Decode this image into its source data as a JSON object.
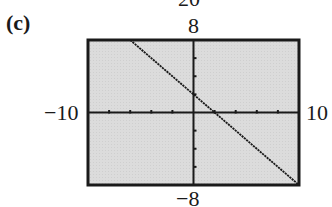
{
  "figure": {
    "part_label": "(c)",
    "cut_off_label": "20",
    "background_color": "#dcdcdc",
    "frame_color": "#1a1a1a",
    "line_color": "#1a1a1a"
  },
  "chart_data": {
    "type": "line",
    "title": "",
    "xlabel": "",
    "ylabel": "",
    "xlim": [
      -10,
      10
    ],
    "ylim": [
      -8,
      8
    ],
    "xscl": 2,
    "yscl": 2,
    "grid": false,
    "tick_labels": {
      "xmin": "−10",
      "xmax": "10",
      "ymin": "−8",
      "ymax": "8"
    },
    "series": [
      {
        "name": "y = -x + 2",
        "x": [
          -6,
          -4,
          -2,
          0,
          2,
          4,
          6,
          8,
          10
        ],
        "y": [
          8,
          6,
          4,
          2,
          0,
          -2,
          -4,
          -6,
          -8
        ]
      }
    ]
  }
}
